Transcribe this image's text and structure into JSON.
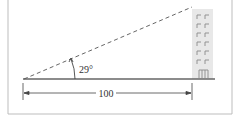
{
  "figure": {
    "angle_label": "29°",
    "distance_label": "100",
    "colors": {
      "frame": "#b8b8b8",
      "line": "#555555",
      "building": "#e6e6e6",
      "window": "#888888"
    }
  }
}
